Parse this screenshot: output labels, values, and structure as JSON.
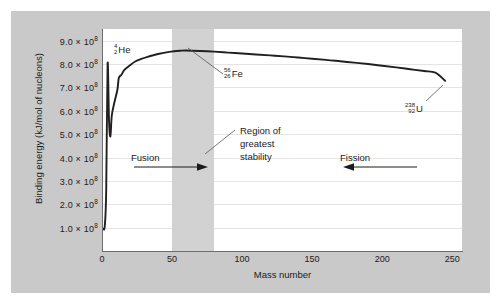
{
  "chart_data": {
    "type": "line",
    "title": "",
    "xlabel": "Mass number",
    "ylabel": "Binding energy (kJ/mol of nucleons)",
    "xlim": [
      0,
      257
    ],
    "ylim": [
      0,
      950000000
    ],
    "xticks": [
      0,
      50,
      100,
      150,
      200,
      250
    ],
    "xtick_labels": [
      "0",
      "50",
      "100",
      "150",
      "200",
      "250"
    ],
    "yticks": [
      100000000,
      200000000,
      300000000,
      400000000,
      500000000,
      600000000,
      700000000,
      800000000,
      900000000
    ],
    "ytick_labels": [
      "1.0 × 10<sup>8</sup>",
      "2.0 × 10<sup>8</sup>",
      "3.0 × 10<sup>8</sup>",
      "4.0 × 10<sup>8</sup>",
      "5.0 × 10<sup>8</sup>",
      "6.0 × 10<sup>8</sup>",
      "7.0 × 10<sup>8</sup>",
      "8.0 × 10<sup>8</sup>",
      "9.0 × 10<sup>8</sup>"
    ],
    "grid": "horizontal",
    "legend": "none",
    "series": [
      {
        "name": "Binding energy per nucleon",
        "color": "#221f1f",
        "x": [
          1,
          2,
          3,
          4,
          5,
          6,
          7,
          9,
          11,
          12,
          14,
          16,
          20,
          24,
          28,
          32,
          40,
          48,
          56,
          60,
          70,
          80,
          90,
          100,
          110,
          120,
          130,
          140,
          150,
          160,
          170,
          180,
          190,
          200,
          210,
          220,
          230,
          238,
          245
        ],
        "y": [
          95000000,
          108000000,
          260000000,
          800000000,
          560000000,
          490000000,
          580000000,
          640000000,
          690000000,
          740000000,
          755000000,
          775000000,
          795000000,
          812000000,
          822000000,
          830000000,
          843000000,
          852000000,
          857000000,
          858000000,
          856000000,
          853000000,
          849000000,
          845000000,
          841000000,
          837000000,
          833000000,
          828000000,
          823000000,
          818000000,
          812000000,
          806000000,
          800000000,
          793000000,
          786000000,
          778000000,
          770000000,
          763000000,
          728000000
        ]
      }
    ],
    "shaded_regions": [
      {
        "name": "region-of-greatest-stability",
        "axis": "x",
        "from": 50,
        "to": 80,
        "color": "#d2d2d2"
      }
    ],
    "annotations": {
      "helium": {
        "mass_number": "4",
        "atomic_number": "2",
        "symbol": "He"
      },
      "iron": {
        "mass_number": "56",
        "atomic_number": "26",
        "symbol": "Fe"
      },
      "uranium": {
        "mass_number": "238",
        "atomic_number": "92",
        "symbol": "U"
      },
      "region": {
        "line1": "Region of",
        "line2": "greatest",
        "line3": "stability"
      },
      "fusion": {
        "label": "Fusion",
        "direction": "right"
      },
      "fission": {
        "label": "Fission",
        "direction": "left"
      }
    }
  },
  "colors": {
    "figure_background": "#c9c9c9",
    "plot_background": "#ffffff",
    "band": "#d2d2d2",
    "curve": "#221f1f",
    "gridline": "#e4e4e4",
    "axis": "#6d6d6d",
    "text": "#1b1b1b"
  }
}
